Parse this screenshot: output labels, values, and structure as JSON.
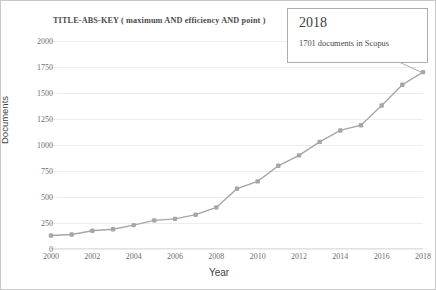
{
  "chart_data": {
    "type": "line",
    "title": "TITLE-ABS-KEY ( maximum  AND efficiency  AND point )",
    "xlabel": "Year",
    "ylabel": "Documents",
    "x": [
      2000,
      2001,
      2002,
      2003,
      2004,
      2005,
      2006,
      2007,
      2008,
      2009,
      2010,
      2011,
      2012,
      2013,
      2014,
      2015,
      2016,
      2017,
      2018
    ],
    "values": [
      130,
      140,
      175,
      190,
      230,
      275,
      290,
      330,
      400,
      580,
      650,
      800,
      900,
      1030,
      1140,
      1190,
      1380,
      1580,
      1701
    ],
    "categories": [
      "2000",
      "2001",
      "2002",
      "2003",
      "2004",
      "2005",
      "2006",
      "2007",
      "2008",
      "2009",
      "2010",
      "2011",
      "2012",
      "2013",
      "2014",
      "2015",
      "2016",
      "2017",
      "2018"
    ],
    "series": [
      {
        "name": "Documents",
        "values": [
          130,
          140,
          175,
          190,
          230,
          275,
          290,
          330,
          400,
          580,
          650,
          800,
          900,
          1030,
          1140,
          1190,
          1380,
          1580,
          1701
        ]
      }
    ],
    "ylim": [
      0,
      2000
    ],
    "xlim": [
      2000,
      2018
    ],
    "yticks": [
      0,
      250,
      500,
      750,
      1000,
      1250,
      1500,
      1750,
      2000
    ],
    "ytick_labels": [
      "0",
      "250",
      "500",
      "750",
      "1000",
      "1250",
      "1500",
      "1750",
      "2000"
    ],
    "xticks": [
      2000,
      2002,
      2004,
      2006,
      2008,
      2010,
      2012,
      2014,
      2016,
      2018
    ],
    "xtick_labels": [
      "2000",
      "2002",
      "2004",
      "2006",
      "2008",
      "2010",
      "2012",
      "2014",
      "2016",
      "2018"
    ],
    "grid": true,
    "legend": false,
    "line_color": "#a6a6a6",
    "marker_color": "#a6a6a6",
    "grid_color": "#ededed",
    "annotations": [
      {
        "name": "callout",
        "title": "2018",
        "text": "1701 documents in Scopus",
        "points_to_x": 2018,
        "points_to_y": 1701
      }
    ]
  },
  "callout": {
    "year": "2018",
    "detail": "1701 documents in Scopus"
  }
}
